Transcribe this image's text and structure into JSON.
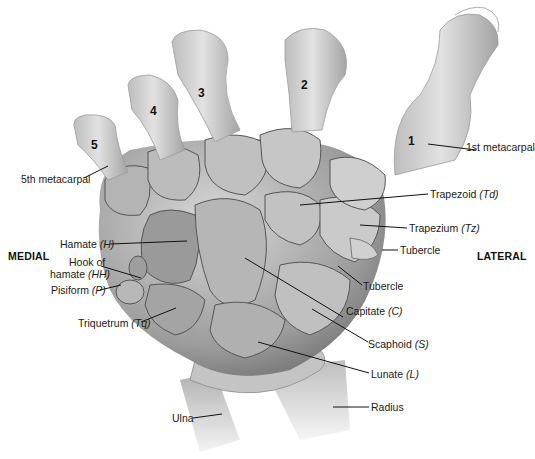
{
  "figure": {
    "orientation": {
      "left": "MEDIAL",
      "right": "LATERAL"
    },
    "metacarpal_numbers": [
      "1",
      "2",
      "3",
      "4",
      "5"
    ],
    "labels": {
      "first_metacarpal": "1st metacarpal",
      "fifth_metacarpal": "5th metacarpal",
      "trapezoid": "Trapezoid",
      "trapezoid_abbr": "(Td)",
      "trapezium": "Trapezium",
      "trapezium_abbr": "(Tz)",
      "tubercle_trapezium": "Tubercle",
      "tubercle_scaphoid": "Tubercle",
      "hamate": "Hamate",
      "hamate_abbr": "(H)",
      "hook_of_hamate_line1": "Hook of",
      "hook_of_hamate_line2": "hamate",
      "hook_of_hamate_abbr": "(HH)",
      "pisiform": "Pisiform",
      "pisiform_abbr": "(P)",
      "triquetrum": "Triquetrum",
      "triquetrum_abbr": "(Tq)",
      "capitate": "Capitate",
      "capitate_abbr": "(C)",
      "scaphoid": "Scaphoid",
      "scaphoid_abbr": "(S)",
      "lunate": "Lunate",
      "lunate_abbr": "(L)",
      "ulna": "Ulna",
      "radius": "Radius"
    },
    "colors": {
      "bone_light": "#d4d4d4",
      "bone_mid": "#a8a8a8",
      "bone_dark": "#6e6e6e",
      "joint_line": "#4a4a4a",
      "leader_line": "#111111",
      "text": "#1a1a1a"
    }
  }
}
